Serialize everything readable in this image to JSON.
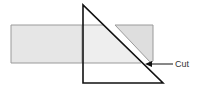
{
  "diagram": {
    "labels": {
      "cut": "Cut"
    },
    "colors": {
      "board_fill": "#e6e6e6",
      "board_stroke": "#999999",
      "triangle_stroke": "#111111",
      "arrow": "#111111"
    }
  }
}
